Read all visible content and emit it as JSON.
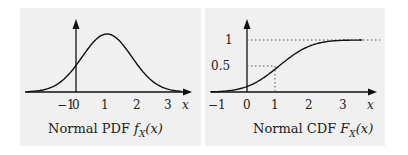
{
  "pdf": {
    "caption_prefix": "Normal PDF ",
    "caption_func": "f",
    "caption_sub": "X",
    "caption_arg": "(x)",
    "axis_label": "x",
    "ticks": [
      "−1",
      "0",
      "1",
      "2",
      "3"
    ]
  },
  "cdf": {
    "caption_prefix": "Normal CDF ",
    "caption_func": "F",
    "caption_sub": "X",
    "caption_arg": "(x)",
    "axis_label": "x",
    "ticks": [
      "−1",
      "0",
      "1",
      "2",
      "3"
    ],
    "y_ticks": [
      "0.5",
      "1"
    ]
  },
  "chart_data": [
    {
      "type": "line",
      "title": "Normal PDF f_X(x)",
      "xlabel": "x",
      "ylabel": "",
      "x_ticks": [
        -1,
        0,
        1,
        2,
        3
      ],
      "series": [
        {
          "name": "Normal PDF",
          "mean": 1,
          "std": 0.8
        }
      ],
      "xlim": [
        -1.5,
        3.4
      ]
    },
    {
      "type": "line",
      "title": "Normal CDF F_X(x)",
      "xlabel": "x",
      "ylabel": "",
      "x_ticks": [
        -1,
        0,
        1,
        2,
        3
      ],
      "y_ticks": [
        0.5,
        1
      ],
      "series": [
        {
          "name": "Normal CDF",
          "mean": 1,
          "std": 0.8
        }
      ],
      "annotations": [
        "dotted guide at y=1",
        "dotted guides at x=1, y=0.5"
      ],
      "xlim": [
        -1.2,
        3.6
      ],
      "ylim": [
        0,
        1.1
      ]
    }
  ]
}
